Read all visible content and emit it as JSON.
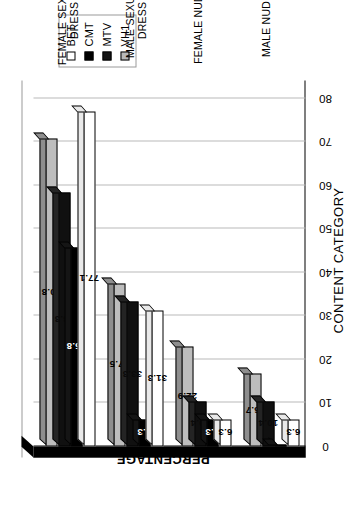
{
  "chart": {
    "type": "bar",
    "orientation": "vertical-3d-rotated",
    "xlabel": "CONTENT CATEGORY",
    "ylabel": "PERCENTAGE"
  },
  "legend": {
    "position": "top-right",
    "entries": [
      {
        "label": "BET",
        "color": "#ffffff",
        "swatch": "sw-bet"
      },
      {
        "label": "CMT",
        "color": "#000000",
        "swatch": "sw-cmt"
      },
      {
        "label": "MTV",
        "color": "#141414",
        "swatch": "sw-mtv"
      },
      {
        "label": "VH1",
        "color": "#b8b8b8",
        "swatch": "sw-vh1"
      }
    ]
  },
  "yaxis": {
    "ticks": [
      "0",
      "10",
      "20",
      "30",
      "40",
      "50",
      "60",
      "70",
      "80"
    ],
    "min": 0,
    "max": 80,
    "step": 10
  },
  "categories": [
    {
      "line1": "MALE NUDITY",
      "line2": ""
    },
    {
      "line1": "FEMALE NUDITY",
      "line2": ""
    },
    {
      "line1": "MALE SEXUAL",
      "line2": "DRESS"
    },
    {
      "line1": "FEMALE SEXUAL",
      "line2": "DRESS"
    }
  ],
  "chart_data": {
    "type": "bar",
    "title": "",
    "xlabel": "CONTENT CATEGORY",
    "ylabel": "PERCENTAGE",
    "ylim": [
      0,
      80
    ],
    "yticks": [
      0,
      10,
      20,
      30,
      40,
      50,
      60,
      70,
      80
    ],
    "grid": true,
    "legend_position": "top-right",
    "categories": [
      "MALE NUDITY",
      "FEMALE NUDITY",
      "MALE SEXUAL DRESS",
      "FEMALE SEXUAL DRESS"
    ],
    "series": [
      {
        "name": "BET",
        "color": "#ffffff",
        "values": [
          6.3,
          6.3,
          31.3,
          77.1
        ],
        "labels": [
          "6.3",
          "6.3",
          "31.3",
          "77.1"
        ]
      },
      {
        "name": "CMT",
        "color": "#000000",
        "values": [
          0.0,
          6.3,
          6.3,
          45.8
        ],
        "labels": [
          "",
          "6.3",
          "6.3",
          "45.8"
        ]
      },
      {
        "name": "MTV",
        "color": "#141414",
        "values": [
          10.4,
          10.4,
          33.3,
          58.3
        ],
        "labels": [
          "10.4",
          "10.4",
          "33.3",
          "58.3"
        ]
      },
      {
        "name": "VH1",
        "color": "#b8b8b8",
        "values": [
          16.7,
          22.9,
          37.5,
          70.8
        ],
        "labels": [
          "16.7",
          "22.9",
          "37.5",
          "70.8"
        ]
      }
    ]
  }
}
